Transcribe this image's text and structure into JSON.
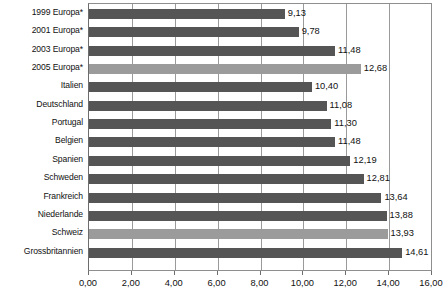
{
  "chart_data": {
    "type": "bar",
    "orientation": "horizontal",
    "title": "",
    "subtitle": "",
    "xlabel": "",
    "ylabel": "",
    "xlim": [
      0,
      16
    ],
    "xticks": [
      "0,00",
      "2,00",
      "4,00",
      "6,00",
      "8,00",
      "10,00",
      "12,00",
      "14,00",
      "16,00"
    ],
    "xtick_values": [
      0,
      2,
      4,
      6,
      8,
      10,
      12,
      14,
      16
    ],
    "grid": "vertical",
    "legend": null,
    "decimal_separator": ",",
    "categories": [
      "1999 Europa*",
      "2001 Europa*",
      "2003 Europa*",
      "2005 Europa*",
      "Italien",
      "Deutschland",
      "Portugal",
      "Belgien",
      "Spanien",
      "Schweden",
      "Frankreich",
      "Niederlande",
      "Schweiz",
      "Grossbritannien"
    ],
    "values": [
      9.13,
      9.78,
      11.48,
      12.68,
      10.4,
      11.08,
      11.3,
      11.48,
      12.19,
      12.81,
      13.64,
      13.88,
      13.93,
      14.61
    ],
    "value_labels": [
      "9,13",
      "9,78",
      "11,48",
      "12,68",
      "10,40",
      "11,08",
      "11,30",
      "11,48",
      "12,19",
      "12,81",
      "13,64",
      "13,88",
      "13,93",
      "14,61"
    ],
    "bar_styles": [
      "dark",
      "dark",
      "dark",
      "light",
      "dark",
      "dark",
      "dark",
      "dark",
      "dark",
      "dark",
      "dark",
      "dark",
      "light",
      "dark"
    ],
    "colors": {
      "bar_dark": "#555555",
      "bar_light": "#9b9b9b",
      "gridline": "#9a9a9a",
      "axis": "#6d6d6d",
      "text": "#111111",
      "background": "#ffffff"
    }
  }
}
